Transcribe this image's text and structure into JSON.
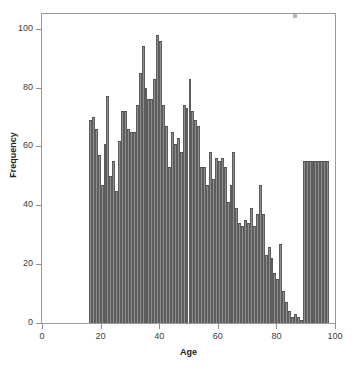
{
  "chart_data": {
    "type": "bar",
    "title": "",
    "subtitle": "",
    "xlabel": "Age",
    "ylabel": "Frequency",
    "xlim": [
      0,
      100
    ],
    "ylim": [
      0,
      105
    ],
    "xticks": [
      0,
      20,
      40,
      60,
      80,
      100
    ],
    "yticks": [
      0,
      20,
      40,
      60,
      80,
      100
    ],
    "xtick_labels": [
      "0",
      "20",
      "40",
      "60",
      "80",
      "100"
    ],
    "ytick_labels": [
      "0",
      "20",
      "40",
      "60",
      "80",
      "100"
    ],
    "grid": false,
    "legend": null,
    "bin_width": 1,
    "bar_color": "#8e8e8e",
    "bar_edge_color": "#4f4f4f",
    "frame_color": "#9a9a9a",
    "categories": [
      16,
      17,
      18,
      19,
      20,
      21,
      22,
      23,
      24,
      25,
      26,
      27,
      28,
      29,
      30,
      31,
      32,
      33,
      34,
      35,
      36,
      37,
      38,
      39,
      40,
      41,
      42,
      43,
      44,
      45,
      46,
      47,
      48,
      49,
      50,
      51,
      52,
      53,
      54,
      55,
      56,
      57,
      58,
      59,
      60,
      61,
      62,
      63,
      64,
      65,
      66,
      67,
      68,
      69,
      70,
      71,
      72,
      73,
      74,
      75,
      76,
      77,
      78,
      79,
      80,
      81,
      82,
      83,
      84,
      85,
      86,
      87,
      88,
      89,
      90,
      91,
      92,
      93,
      94,
      95,
      96,
      97
    ],
    "values": [
      69,
      70,
      66,
      57,
      47,
      61,
      77,
      50,
      55,
      45,
      62,
      72,
      72,
      66,
      65,
      65,
      74,
      85,
      94,
      80,
      76,
      76,
      83,
      98,
      96,
      74,
      67,
      53,
      65,
      61,
      63,
      58,
      74,
      73,
      83,
      72,
      69,
      67,
      53,
      53,
      47,
      58,
      49,
      56,
      55,
      56,
      53,
      41,
      47,
      58,
      39,
      34,
      33,
      35,
      34,
      39,
      33,
      37,
      47,
      37,
      23,
      26,
      22,
      17,
      15,
      27,
      11,
      7,
      4,
      2,
      3,
      2,
      1,
      55,
      55,
      55,
      55,
      55,
      55,
      55,
      55,
      55
    ],
    "annotations": []
  },
  "axes": {
    "x_title": "Age",
    "y_title": "Frequency"
  },
  "artifacts": {
    "speck_name": "image-artifact-speck"
  }
}
